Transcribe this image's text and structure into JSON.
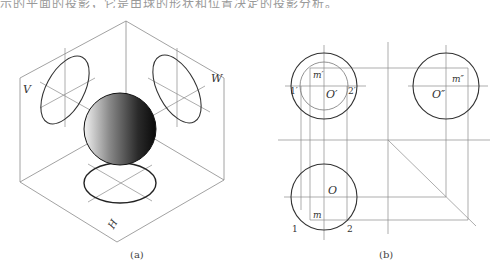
{
  "page": {
    "cut_text_line": "示的平面的投影，它是由球的形状和位置决定的投影分析。",
    "colors": {
      "line": "#555555",
      "thin_line": "#8a8a8a",
      "background": "#ffffff"
    }
  },
  "figure_a": {
    "caption": "(a)",
    "labels": {
      "v_plane": "V",
      "w_plane": "W",
      "h_plane": "H"
    },
    "description": "Isometric view of a sphere inside three projection planes V, W, H with its circular projections on each plane"
  },
  "figure_b": {
    "caption": "(b)",
    "front_view": {
      "center": "O′",
      "point": "m′",
      "left_point": "1′",
      "right_point": "2′"
    },
    "side_view": {
      "center": "O″",
      "point": "m″"
    },
    "top_view": {
      "center": "O",
      "point": "m",
      "left_point": "1",
      "right_point": "2"
    }
  }
}
